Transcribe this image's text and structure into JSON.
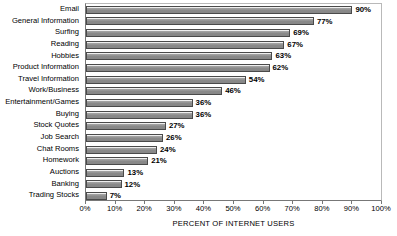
{
  "chart_data": {
    "type": "bar",
    "orientation": "horizontal",
    "title": "",
    "xlabel": "PERCENT OF INTERNET USERS",
    "ylabel": "",
    "xlim": [
      0,
      100
    ],
    "grid": false,
    "legend": null,
    "xtick_labels": [
      "0%",
      "10%",
      "20%",
      "30%",
      "40%",
      "50%",
      "60%",
      "70%",
      "80%",
      "90%",
      "100%"
    ],
    "xtick_values": [
      0,
      10,
      20,
      30,
      40,
      50,
      60,
      70,
      80,
      90,
      100
    ],
    "categories": [
      "Email",
      "General Information",
      "Surfing",
      "Reading",
      "Hobbies",
      "Product Information",
      "Travel Information",
      "Work/Business",
      "Entertainment/Games",
      "Buying",
      "Stock Quotes",
      "Job Search",
      "Chat Rooms",
      "Homework",
      "Auctions",
      "Banking",
      "Trading Stocks"
    ],
    "values": [
      90,
      77,
      69,
      67,
      63,
      62,
      54,
      46,
      36,
      36,
      27,
      26,
      24,
      21,
      13,
      12,
      7
    ],
    "value_labels": [
      "90%",
      "77%",
      "69%",
      "67%",
      "63%",
      "62%",
      "54%",
      "46%",
      "36%",
      "36%",
      "27%",
      "26%",
      "24%",
      "21%",
      "13%",
      "12%",
      "7%"
    ],
    "bar_color": "#8a8a8a",
    "bar_edge_color": "#4a4a4a",
    "background_color": "#ffffff",
    "axis_color": "#777777"
  }
}
